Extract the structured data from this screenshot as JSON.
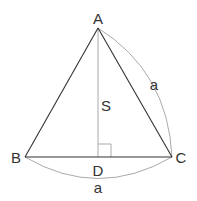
{
  "diagram": {
    "type": "geometry",
    "vertices": {
      "A": {
        "label": "A",
        "x": 98,
        "y": 28
      },
      "B": {
        "label": "B",
        "x": 25,
        "y": 157
      },
      "C": {
        "label": "C",
        "x": 172,
        "y": 157
      },
      "D": {
        "label": "D",
        "x": 98,
        "y": 157
      }
    },
    "segments": [
      {
        "from": "A",
        "to": "B",
        "style": "solid-dark"
      },
      {
        "from": "A",
        "to": "C",
        "style": "solid-dark"
      },
      {
        "from": "B",
        "to": "C",
        "style": "solid-dark"
      },
      {
        "from": "A",
        "to": "D",
        "style": "solid-light",
        "label": "S"
      }
    ],
    "arcs": [
      {
        "from": "A",
        "to": "C",
        "label": "a"
      },
      {
        "from": "B",
        "to": "C",
        "label": "a"
      }
    ],
    "right_angle_marker": {
      "at": "D"
    },
    "labels": {
      "A": "A",
      "B": "B",
      "C": "C",
      "D": "D",
      "altitude": "S",
      "arc_ac": "a",
      "arc_bc": "a"
    },
    "colors": {
      "dark_line": "#333333",
      "light_line": "#aaaaaa",
      "text": "#333333"
    }
  }
}
